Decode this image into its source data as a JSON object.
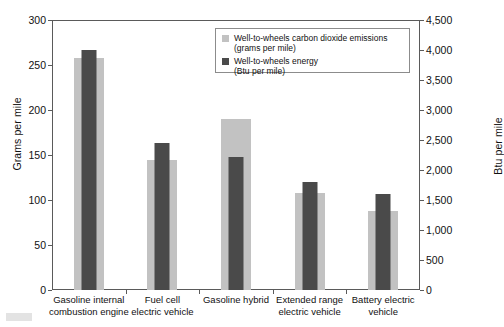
{
  "chart_data": {
    "type": "bar",
    "title": "",
    "categories": [
      "Gasoline internal combustion engine",
      "Fuel cell electric vehicle",
      "Gasoline hybrid",
      "Extended range electric vehicle",
      "Battery electric vehicle"
    ],
    "series": [
      {
        "name": "Well-to-wheels carbon dioxide emissions (grams per mile)",
        "axis": "left",
        "unit": "grams per mile",
        "color": "#c2c2c2",
        "values": [
          258,
          145,
          190,
          108,
          88
        ]
      },
      {
        "name": "Well-to-wheels energy (Btu per mile)",
        "axis": "right",
        "unit": "Btu per mile",
        "color": "#4a4a4a",
        "values": [
          4000,
          2450,
          2220,
          1800,
          1600
        ]
      }
    ],
    "xlabel": "",
    "ylabel": "Grams per mile",
    "y2label": "Btu per mile",
    "ylim": [
      0,
      300
    ],
    "y2lim": [
      0,
      4500
    ],
    "yticks": [
      0,
      50,
      100,
      150,
      200,
      250,
      300
    ],
    "y2ticks": [
      0,
      500,
      1000,
      1500,
      2000,
      2500,
      3000,
      3500,
      4000,
      4500
    ],
    "ytick_labels": [
      "0",
      "50",
      "100",
      "150",
      "200",
      "250",
      "300"
    ],
    "y2tick_labels": [
      "0",
      "500",
      "1,000",
      "1,500",
      "2,000",
      "2,500",
      "3,000",
      "3,500",
      "4,000",
      "4,500"
    ],
    "grid": false,
    "legend_position": "top-right"
  },
  "axes": {
    "left_title": "Grams per mile",
    "right_title": "Btu per mile"
  },
  "legend": {
    "items": [
      {
        "line1": "Well-to-wheels carbon dioxide emissions",
        "line2": "(grams per mile)",
        "color": "#c2c2c2"
      },
      {
        "line1": "Well-to-wheels energy",
        "line2": "(Btu per mile)",
        "color": "#4a4a4a"
      }
    ]
  },
  "categories_display": [
    {
      "line1": "Gasoline internal",
      "line2": "combustion engine"
    },
    {
      "line1": "Fuel cell",
      "line2": "electric vehicle"
    },
    {
      "line1": "Gasoline hybrid",
      "line2": ""
    },
    {
      "line1": "Extended range",
      "line2": "electric vehicle"
    },
    {
      "line1": "Battery electric",
      "line2": "vehicle"
    }
  ]
}
